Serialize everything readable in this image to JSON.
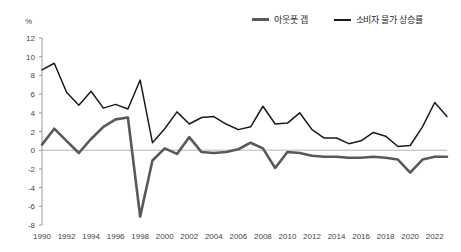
{
  "unit_label": "%",
  "legend": {
    "position": "top-right",
    "items": [
      {
        "label": "아웃풋 갭",
        "color": "#595959",
        "key": "output_gap"
      },
      {
        "label": "소비자 물가 상승률",
        "color": "#1a1a1a",
        "key": "cpi_inflation"
      }
    ]
  },
  "chart_data": {
    "type": "line",
    "title": "",
    "subtitle": "",
    "xlabel": "",
    "ylabel": "%",
    "unit": "%",
    "grid": false,
    "zero_line": true,
    "legend_position": "top-right",
    "xlim": [
      1990,
      2023
    ],
    "ylim": [
      -8,
      12
    ],
    "ytick_step": 2,
    "yticks": [
      12,
      10,
      8,
      6,
      4,
      2,
      0,
      -2,
      -4,
      -6,
      -8
    ],
    "ytick_labels": [
      "12",
      "10",
      "8",
      "6",
      "4",
      "2",
      "0",
      "-2",
      "-4",
      "-6",
      "-8"
    ],
    "xticks": [
      1990,
      1992,
      1994,
      1996,
      1998,
      2000,
      2002,
      2004,
      2006,
      2008,
      2010,
      2012,
      2014,
      2016,
      2018,
      2020,
      2022
    ],
    "xtick_labels": [
      "1990",
      "1992",
      "1994",
      "1996",
      "1998",
      "2000",
      "2002",
      "2004",
      "2006",
      "2008",
      "2010",
      "2012",
      "2014",
      "2016",
      "2018",
      "2020",
      "2022"
    ],
    "x": [
      1990,
      1991,
      1992,
      1993,
      1994,
      1995,
      1996,
      1997,
      1998,
      1999,
      2000,
      2001,
      2002,
      2003,
      2004,
      2005,
      2006,
      2007,
      2008,
      2009,
      2010,
      2011,
      2012,
      2013,
      2014,
      2015,
      2016,
      2017,
      2018,
      2019,
      2020,
      2021,
      2022,
      2023
    ],
    "series": [
      {
        "name": "아웃풋 갭",
        "key": "output_gap",
        "color": "#595959",
        "width": 2.6,
        "values": [
          0.6,
          2.3,
          1.0,
          -0.3,
          1.2,
          2.5,
          3.3,
          3.5,
          -7.1,
          -1.1,
          0.2,
          -0.4,
          1.4,
          -0.2,
          -0.3,
          -0.2,
          0.1,
          0.8,
          0.2,
          -1.9,
          -0.2,
          -0.3,
          -0.6,
          -0.7,
          -0.7,
          -0.8,
          -0.8,
          -0.7,
          -0.8,
          -1.0,
          -2.4,
          -1.0,
          -0.7,
          -0.7
        ]
      },
      {
        "name": "소비자 물가 상승률",
        "key": "cpi_inflation",
        "color": "#1a1a1a",
        "width": 1.5,
        "values": [
          8.6,
          9.3,
          6.2,
          4.8,
          6.3,
          4.5,
          4.9,
          4.4,
          7.5,
          0.8,
          2.3,
          4.1,
          2.8,
          3.5,
          3.6,
          2.8,
          2.2,
          2.5,
          4.7,
          2.8,
          2.9,
          4.0,
          2.2,
          1.3,
          1.3,
          0.7,
          1.0,
          1.9,
          1.5,
          0.4,
          0.5,
          2.5,
          5.1,
          3.6
        ]
      }
    ]
  }
}
